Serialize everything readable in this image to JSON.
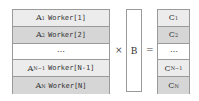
{
  "matrix_a": {
    "rows": [
      {
        "label": "A",
        "sub": "1",
        "worker": "Worker[1]",
        "shade": "light"
      },
      {
        "label": "A",
        "sub": "2",
        "worker": "Worker[2]",
        "shade": "dark"
      },
      {
        "label": "⋯",
        "sub": "",
        "worker": "",
        "shade": "white"
      },
      {
        "label": "A",
        "sub": "N−1",
        "worker": "Worker[N-1]",
        "shade": "light"
      },
      {
        "label": "A",
        "sub": "N",
        "worker": "Worker[N]",
        "shade": "dark"
      }
    ]
  },
  "operators": {
    "multiply": "×",
    "equals": "="
  },
  "matrix_b": {
    "label": "B"
  },
  "matrix_c": {
    "rows": [
      {
        "label": "C",
        "sub": "1",
        "shade": "light"
      },
      {
        "label": "C",
        "sub": "2",
        "shade": "dark"
      },
      {
        "label": "⋯",
        "sub": "",
        "shade": "white"
      },
      {
        "label": "C",
        "sub": "N−1",
        "shade": "light"
      },
      {
        "label": "C",
        "sub": "N",
        "shade": "dark"
      }
    ]
  }
}
